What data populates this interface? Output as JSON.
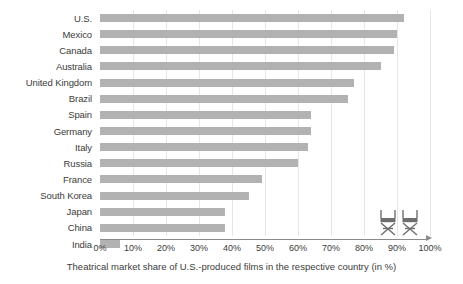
{
  "chart_data": {
    "type": "bar",
    "orientation": "horizontal",
    "title": "",
    "subtitle": "",
    "xlabel": "Theatrical market share of U.S.-produced films in the respective country (in %)",
    "ylabel": "",
    "xlim": [
      0,
      100
    ],
    "ylim": null,
    "grid": true,
    "grid_axis": "x",
    "legend": null,
    "legend_position": "none",
    "categories": [
      "U.S.",
      "Mexico",
      "Canada",
      "Australia",
      "United Kingdom",
      "Brazil",
      "Spain",
      "Germany",
      "Italy",
      "Russia",
      "France",
      "South Korea",
      "Japan",
      "China",
      "India"
    ],
    "values": [
      92,
      90,
      89,
      85,
      77,
      75,
      64,
      64,
      63,
      60,
      49,
      45,
      38,
      38,
      6
    ],
    "xticks": [
      0,
      10,
      20,
      30,
      40,
      50,
      60,
      70,
      80,
      90,
      100
    ],
    "xticklabels": [
      "0%",
      "10%",
      "20%",
      "30%",
      "40%",
      "50%",
      "60%",
      "70%",
      "80%",
      "90%",
      "100%"
    ],
    "bar_color": "#b2b2b2",
    "gridline_color": "#e6e6ea",
    "axis_color": "#8a8a8a",
    "text_color": "#3b3b3b",
    "background_color": "#ffffff",
    "annotations": [
      {
        "name": "director-chair-icon-1",
        "label": "director's chair"
      },
      {
        "name": "director-chair-icon-2",
        "label": "director's chair"
      }
    ]
  }
}
